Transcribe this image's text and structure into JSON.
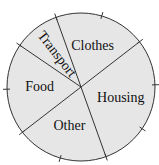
{
  "chart_data": {
    "type": "pie",
    "title": "",
    "unit": "percent",
    "slices": [
      {
        "label": "Clothes",
        "value": 20,
        "rotated": false
      },
      {
        "label": "Transport",
        "value": 10,
        "rotated": true
      },
      {
        "label": "Food",
        "value": 20,
        "rotated": false
      },
      {
        "label": "Other",
        "value": 20,
        "rotated": false
      },
      {
        "label": "Housing",
        "value": 30,
        "rotated": false
      }
    ],
    "start_angle_deg": 37.7,
    "direction": "counterclockwise",
    "tick_divisions": 10,
    "colors": {
      "fill": "#e6e6e6",
      "line": "#333333",
      "text": "#111111"
    },
    "legend": "none"
  }
}
